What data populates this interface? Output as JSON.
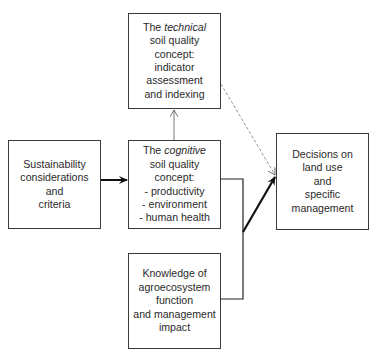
{
  "diagram": {
    "boxes": {
      "technical": {
        "line1_pre": "The ",
        "line1_em": "technical",
        "lines": [
          "soil quality",
          "concept:",
          "indicator",
          "assessment",
          "and indexing"
        ]
      },
      "sustainability": {
        "lines": [
          "Sustainability",
          "considerations",
          "and",
          "criteria"
        ]
      },
      "cognitive": {
        "line1_pre": "The ",
        "line1_em": "cognitive",
        "lines": [
          "soil quality",
          "concept:",
          "- productivity",
          "- environment",
          "- human health"
        ]
      },
      "knowledge": {
        "lines": [
          "Knowledge of",
          "agroecosystem",
          "function",
          "and management",
          "impact"
        ]
      },
      "decisions": {
        "lines": [
          "Decisions on",
          "land use",
          "and",
          "specific",
          "management"
        ]
      }
    },
    "connections": [
      {
        "from": "sustainability",
        "to": "cognitive",
        "style": "thick-arrow"
      },
      {
        "from": "cognitive",
        "to": "technical",
        "style": "thin-arrow"
      },
      {
        "from": "technical",
        "to": "decisions",
        "style": "dashed-thin-arrow"
      },
      {
        "from": "cognitive+knowledge",
        "to": "decisions",
        "style": "thick-arrow"
      }
    ],
    "colors": {
      "line": "#1a1a1a",
      "box_border": "#3a3a3a",
      "dashed": "#777777"
    }
  }
}
